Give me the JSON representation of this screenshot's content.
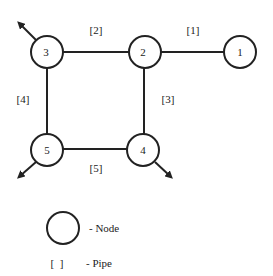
{
  "diagram": {
    "nodes": [
      {
        "id": "1",
        "label": "1",
        "cx": 240,
        "cy": 52
      },
      {
        "id": "2",
        "label": "2",
        "cx": 145,
        "cy": 52
      },
      {
        "id": "3",
        "label": "3",
        "cx": 47,
        "cy": 52
      },
      {
        "id": "4",
        "label": "4",
        "cx": 143,
        "cy": 150
      },
      {
        "id": "5",
        "label": "5",
        "cx": 47,
        "cy": 150
      }
    ],
    "pipes": [
      {
        "id": "1",
        "label": "[1]",
        "from": "2",
        "to": "1"
      },
      {
        "id": "2",
        "label": "[2]",
        "from": "3",
        "to": "2"
      },
      {
        "id": "3",
        "label": "[3]",
        "from": "2",
        "to": "4"
      },
      {
        "id": "4",
        "label": "[4]",
        "from": "3",
        "to": "5"
      },
      {
        "id": "5",
        "label": "[5]",
        "from": "5",
        "to": "4"
      }
    ],
    "flows": [
      {
        "node": "3",
        "direction": "up-left"
      },
      {
        "node": "5",
        "direction": "down-left"
      },
      {
        "node": "4",
        "direction": "down-right"
      }
    ]
  },
  "legend": {
    "node_symbol": "",
    "node_text": "- Node",
    "pipe_symbol": "[  ]",
    "pipe_text": "- Pipe"
  }
}
